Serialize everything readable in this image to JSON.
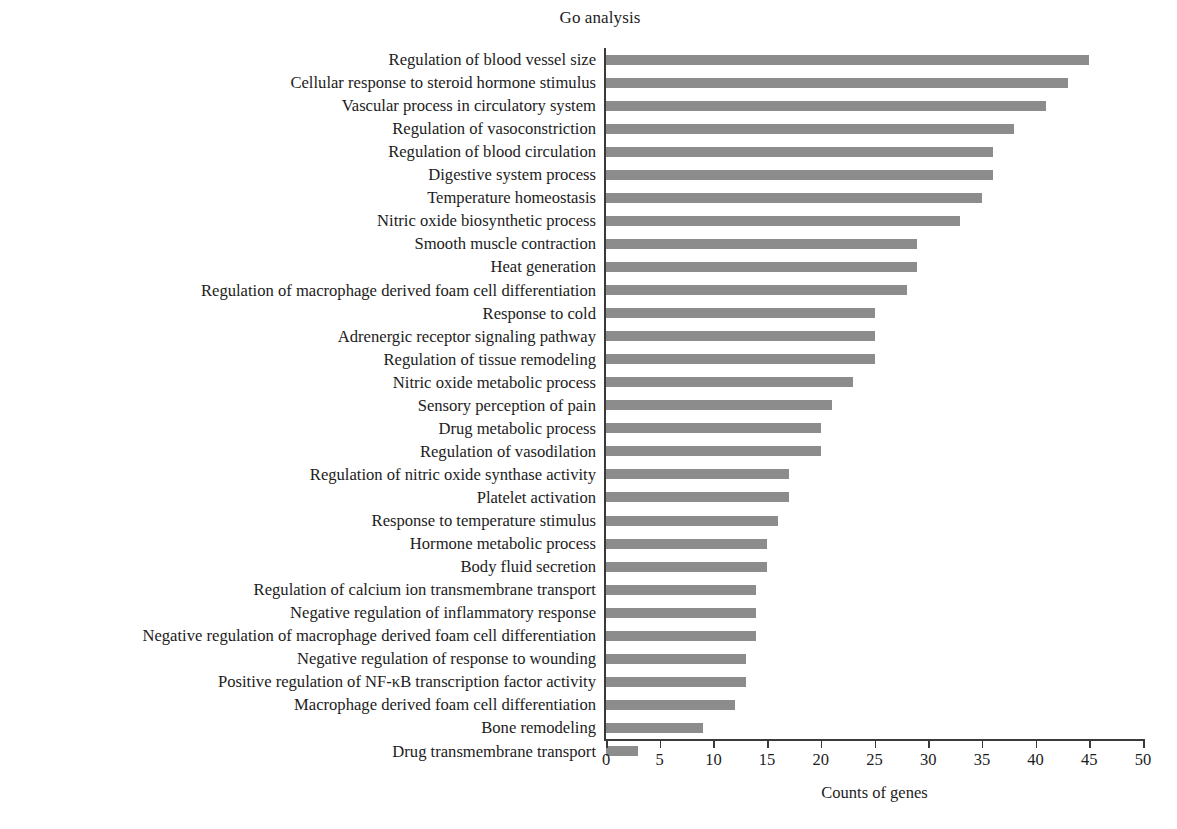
{
  "chart_data": {
    "type": "bar",
    "orientation": "horizontal",
    "title": "Go analysis",
    "xlabel": "Counts of genes",
    "ylabel": "",
    "xlim": [
      0,
      50
    ],
    "xticks": [
      0,
      5,
      10,
      15,
      20,
      25,
      30,
      35,
      40,
      45,
      50
    ],
    "grid": false,
    "legend": null,
    "bar_color": "#8c8c8c",
    "axis_color": "#3a3a3a",
    "text_color": "#1c1c1c",
    "categories": [
      "Regulation of blood vessel size",
      "Cellular response to steroid hormone stimulus",
      "Vascular process in circulatory system",
      "Regulation of vasoconstriction",
      "Regulation of blood circulation",
      "Digestive system process",
      "Temperature homeostasis",
      "Nitric oxide biosynthetic process",
      "Smooth muscle contraction",
      "Heat generation",
      "Regulation of macrophage derived foam cell differentiation",
      "Response to cold",
      "Adrenergic receptor signaling pathway",
      "Regulation of tissue remodeling",
      "Nitric oxide metabolic process",
      "Sensory perception of pain",
      "Drug metabolic process",
      "Regulation of vasodilation",
      "Regulation of nitric oxide synthase activity",
      "Platelet activation",
      "Response to temperature stimulus",
      "Hormone metabolic process",
      "Body fluid secretion",
      "Regulation of calcium ion transmembrane transport",
      "Negative regulation of inflammatory response",
      "Negative regulation of macrophage derived foam cell differentiation",
      "Negative regulation of response to wounding",
      "Positive regulation of NF-κB transcription factor activity",
      "Macrophage derived foam cell differentiation",
      "Bone remodeling",
      "Drug transmembrane transport"
    ],
    "values": [
      45,
      43,
      41,
      38,
      36,
      36,
      35,
      33,
      29,
      29,
      28,
      25,
      25,
      25,
      23,
      21,
      20,
      20,
      17,
      17,
      16,
      15,
      15,
      14,
      14,
      14,
      13,
      13,
      12,
      9,
      3
    ]
  }
}
